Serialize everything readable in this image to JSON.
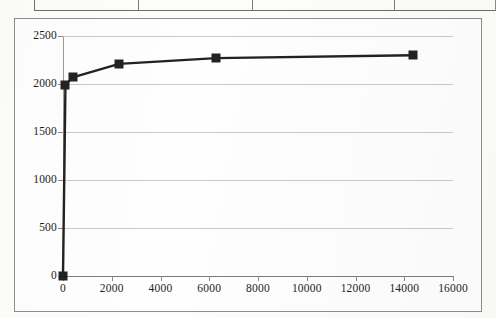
{
  "table_fragment": {
    "name": "partial-table-above-chart",
    "cells": [
      "",
      "",
      "",
      ""
    ]
  },
  "chart_data": {
    "type": "line",
    "title": "",
    "subtitle": "",
    "xlabel": "",
    "ylabel": "",
    "xlim": [
      0,
      16000
    ],
    "ylim": [
      0,
      2500
    ],
    "x_ticks": [
      0,
      2000,
      4000,
      6000,
      8000,
      10000,
      12000,
      14000,
      16000
    ],
    "x_tick_labels": [
      "0",
      "2000",
      "4000",
      "6000",
      "8000",
      "10000",
      "12000",
      "14000",
      "16000"
    ],
    "y_ticks": [
      0,
      500,
      1000,
      1500,
      2000,
      2500
    ],
    "y_tick_labels": [
      "0",
      "500",
      "1000",
      "1500",
      "2000",
      "2500"
    ],
    "grid": {
      "horizontal": true,
      "vertical": false
    },
    "legend": {
      "visible": false,
      "position": "none"
    },
    "marker": {
      "shape": "square",
      "size": 9,
      "color": "#222222"
    },
    "line": {
      "color": "#222222",
      "width": 2.4
    },
    "series": [
      {
        "name": "series-1",
        "x": [
          0,
          100,
          400,
          2300,
          6280,
          14350
        ],
        "y": [
          0,
          1990,
          2070,
          2210,
          2270,
          2300
        ]
      }
    ]
  }
}
